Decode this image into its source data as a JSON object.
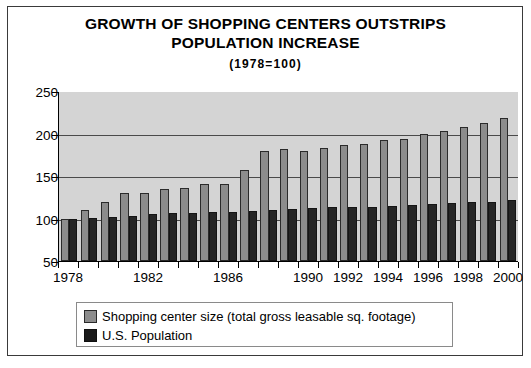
{
  "chart_data": {
    "type": "bar",
    "title": "GROWTH OF SHOPPING CENTERS OUTSTRIPS POPULATION INCREASE",
    "subtitle": "(1978=100)",
    "xlabel": "",
    "ylabel": "",
    "ylim": [
      50,
      250
    ],
    "yticks": [
      50,
      100,
      150,
      200,
      250
    ],
    "grid": true,
    "legend_position": "bottom",
    "categories": [
      "1978",
      "1979",
      "1980",
      "1981",
      "1982",
      "1983",
      "1984",
      "1985",
      "1986",
      "1987",
      "1988",
      "1989",
      "1990",
      "1991",
      "1992",
      "1993",
      "1994",
      "1995",
      "1996",
      "1997",
      "1998",
      "1999",
      "2000"
    ],
    "visible_tick_labels": [
      "1978",
      "1982",
      "1986",
      "1990",
      "1992",
      "1994",
      "1996",
      "1998",
      "2000"
    ],
    "series": [
      {
        "name": "Shopping center size (total gross leasable sq. footage)",
        "color": "#8c8c8c",
        "values": [
          100,
          110,
          120,
          130,
          130,
          135,
          136,
          141,
          141,
          157,
          180,
          182,
          180,
          183,
          187,
          188,
          192,
          194,
          199,
          203,
          208,
          212,
          218
        ]
      },
      {
        "name": "U.S. Population",
        "color": "#262626",
        "values": [
          100,
          101,
          102,
          103,
          105,
          106,
          107,
          108,
          108,
          109,
          110,
          111,
          112,
          113,
          113,
          114,
          115,
          116,
          117,
          118,
          119,
          120,
          122
        ]
      }
    ]
  },
  "legend": {
    "items": [
      {
        "label": "Shopping center size (total gross leasable sq. footage)",
        "swatch": "gray-swatch"
      },
      {
        "label": "U.S. Population",
        "swatch": "black-swatch"
      }
    ]
  },
  "colors": {
    "series_a": "#8c8c8c",
    "series_b": "#262626",
    "plot_background": "#d4d4d4",
    "page_background": "#ffffff",
    "border": "#3a3a3a"
  }
}
